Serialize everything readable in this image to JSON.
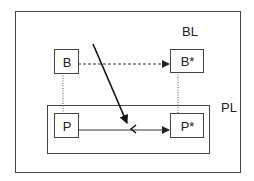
{
  "diagram": {
    "outer_box": {
      "label": "BL"
    },
    "inner_box": {
      "label": "PL"
    },
    "nodes": {
      "B": {
        "label": "B"
      },
      "B_star": {
        "label": "B*"
      },
      "P": {
        "label": "P"
      },
      "P_star": {
        "label": "P*"
      }
    },
    "edges": [
      {
        "from": "B",
        "to": "B*",
        "style": "dashed",
        "arrow": "end"
      },
      {
        "from": "P",
        "to": "P*",
        "style": "solid",
        "arrow": "end"
      },
      {
        "from": "B",
        "to": "P",
        "style": "dotted",
        "arrow": "none"
      },
      {
        "from": "B*",
        "to": "P*",
        "style": "dotted",
        "arrow": "none"
      },
      {
        "from": "above",
        "to": "P→P* edge",
        "style": "solid-bold",
        "arrow": "end",
        "note": "diagonal arrow intersecting dashed edge, terminating with '<' mark on P→P* line"
      }
    ],
    "colors": {
      "stroke": "#333333",
      "background": "#ffffff"
    }
  }
}
